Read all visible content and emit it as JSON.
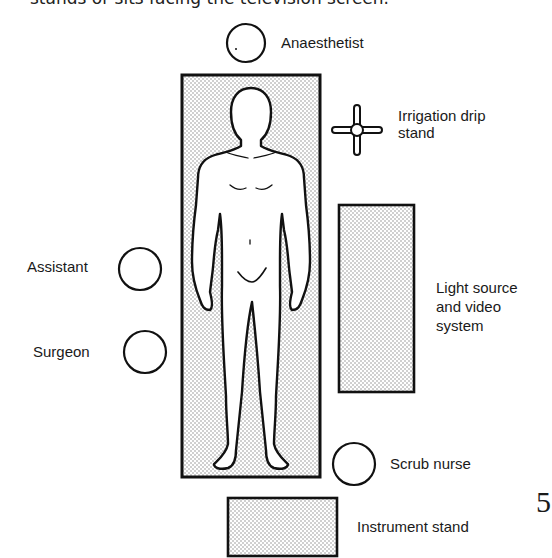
{
  "caption": "stands or sits facing the television screen.",
  "page_number": "5",
  "labels": {
    "anaesthetist": "Anaesthetist",
    "irrigation_line1": "Irrigation drip",
    "irrigation_line2": "stand",
    "assistant": "Assistant",
    "surgeon": "Surgeon",
    "light_line1": "Light source",
    "light_line2": "and video",
    "light_line3": "system",
    "scrub_nurse": "Scrub nurse",
    "instrument_stand": "Instrument stand"
  },
  "colors": {
    "stroke": "#111111",
    "stipple": "#9a9a9a",
    "background": "#ffffff"
  }
}
